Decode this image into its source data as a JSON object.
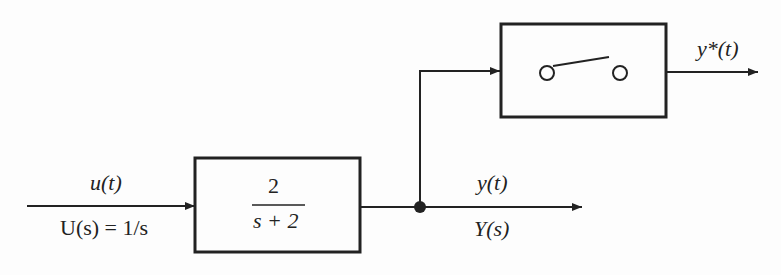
{
  "diagram": {
    "type": "block-diagram",
    "input": {
      "time_label": "u(t)",
      "laplace_label": "U(s) = 1/s"
    },
    "transfer_function": {
      "numerator": "2",
      "denominator": "s + 2"
    },
    "output": {
      "time_label": "y(t)",
      "laplace_label": "Y(s)"
    },
    "sampler": {
      "name": "ideal sampler switch",
      "output_label": "y*(t)"
    },
    "colors": {
      "stroke": "#222222",
      "background": "#fdfdfd"
    }
  }
}
